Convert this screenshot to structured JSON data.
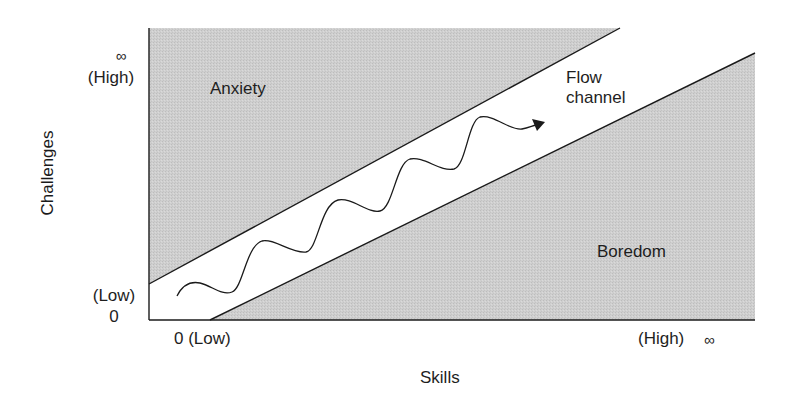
{
  "diagram": {
    "regions": {
      "anxiety": "Anxiety",
      "flow": "Flow channel",
      "flow_line1": "Flow",
      "flow_line2": "channel",
      "boredom": "Boredom"
    },
    "y_axis": {
      "label": "Challenges",
      "top_symbol": "∞",
      "top_label": "(High)",
      "bottom_label": "(Low)",
      "bottom_value": "0"
    },
    "x_axis": {
      "label": "Skills",
      "left_label": "0 (Low)",
      "right_label": "(High)",
      "right_symbol": "∞"
    },
    "colors": {
      "region_fill": "#cdcdcd",
      "line": "#1a1a1a",
      "background": "#ffffff"
    },
    "path_description": "wavy arrow oscillating within the flow channel from lower-left to upper-right"
  }
}
